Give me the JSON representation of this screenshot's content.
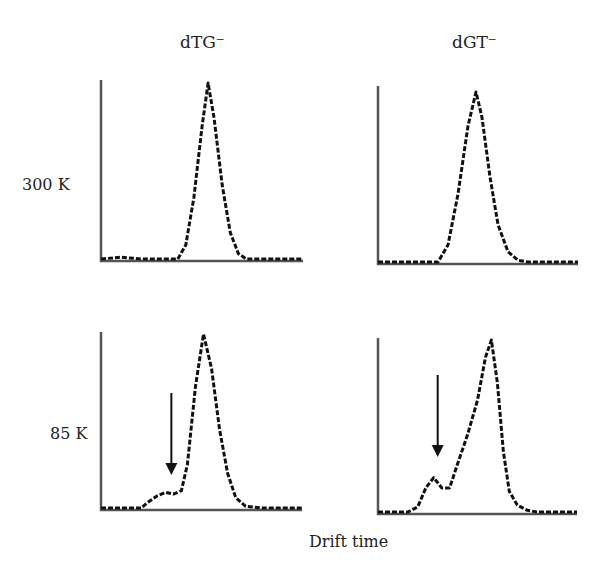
{
  "figure": {
    "column_titles": [
      "dTG⁻",
      "dGT⁻"
    ],
    "row_labels": [
      "300 K",
      "85 K"
    ],
    "xlabel": "Drift time"
  },
  "chart_data": {
    "type": "line",
    "title": "",
    "xlabel": "Drift time",
    "ylabel": "",
    "grid": false,
    "legend": null,
    "layout": "2x2 grid of panels; columns = anion (dTG⁻, dGT⁻), rows = temperature (300 K, 85 K)",
    "axis_ticks": "none shown",
    "panels": [
      {
        "id": "dTG-300K",
        "column": "dTG⁻",
        "row": "300 K",
        "description": "Single near-Gaussian peak centered mid-right of drift time range",
        "x": [
          0.0,
          0.1,
          0.2,
          0.3,
          0.38,
          0.42,
          0.46,
          0.5,
          0.53,
          0.56,
          0.6,
          0.64,
          0.68,
          0.72,
          0.8,
          0.9,
          1.0
        ],
        "y": [
          0.0,
          0.01,
          0.0,
          0.0,
          0.0,
          0.08,
          0.35,
          0.75,
          1.0,
          0.8,
          0.42,
          0.15,
          0.03,
          0.0,
          0.0,
          0.0,
          0.0
        ]
      },
      {
        "id": "dGT-300K",
        "column": "dGT⁻",
        "row": "300 K",
        "description": "Single near-Gaussian peak",
        "x": [
          0.0,
          0.2,
          0.3,
          0.35,
          0.4,
          0.45,
          0.49,
          0.52,
          0.56,
          0.6,
          0.65,
          0.7,
          0.75,
          0.85,
          1.0
        ],
        "y": [
          0.0,
          0.0,
          0.0,
          0.1,
          0.4,
          0.8,
          1.0,
          0.85,
          0.5,
          0.22,
          0.06,
          0.01,
          0.0,
          0.0,
          0.0
        ]
      },
      {
        "id": "dTG-85K",
        "column": "dTG⁻",
        "row": "85 K",
        "description": "Main peak plus weak low-drift-time shoulder (indicated by arrow)",
        "annotation": {
          "type": "arrow",
          "x": 0.35,
          "pointing": "down",
          "target": "shoulder"
        },
        "x": [
          0.0,
          0.1,
          0.2,
          0.23,
          0.28,
          0.32,
          0.36,
          0.4,
          0.43,
          0.47,
          0.51,
          0.55,
          0.59,
          0.63,
          0.67,
          0.72,
          0.8,
          0.9,
          1.0
        ],
        "y": [
          0.0,
          0.0,
          0.0,
          0.03,
          0.07,
          0.09,
          0.08,
          0.1,
          0.25,
          0.7,
          1.0,
          0.8,
          0.45,
          0.2,
          0.06,
          0.01,
          0.0,
          0.0,
          0.0
        ]
      },
      {
        "id": "dGT-85K",
        "column": "dGT⁻",
        "row": "85 K",
        "description": "Main peak plus distinct low-drift-time minor peak (indicated by arrow)",
        "annotation": {
          "type": "arrow",
          "x": 0.3,
          "pointing": "down",
          "target": "minor peak"
        },
        "x": [
          0.0,
          0.15,
          0.2,
          0.24,
          0.28,
          0.32,
          0.36,
          0.4,
          0.45,
          0.5,
          0.54,
          0.57,
          0.6,
          0.63,
          0.66,
          0.7,
          0.75,
          0.8,
          1.0
        ],
        "y": [
          0.0,
          0.0,
          0.03,
          0.14,
          0.2,
          0.14,
          0.14,
          0.28,
          0.45,
          0.65,
          0.9,
          1.0,
          0.75,
          0.35,
          0.12,
          0.04,
          0.01,
          0.0,
          0.0
        ]
      }
    ]
  }
}
